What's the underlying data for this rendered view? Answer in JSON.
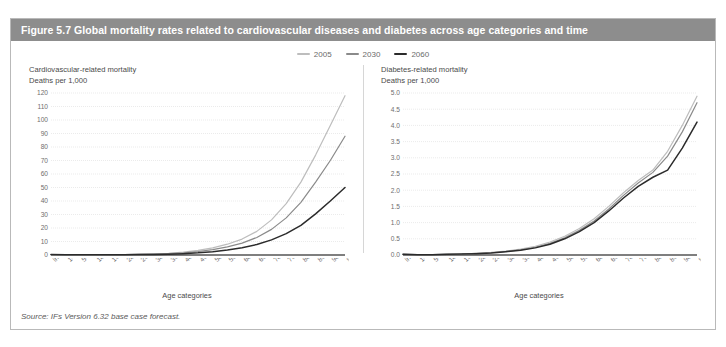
{
  "figure": {
    "title": "Figure 5.7 Global mortality rates related to cardiovascular diseases and diabetes across age categories and time",
    "source": "Source: IFs Version 6.32 base case forecast.",
    "header_color": "#8d8d8d",
    "border_color": "#b9b9b9"
  },
  "legend": {
    "position": "top-center",
    "entries": [
      {
        "label": "2005",
        "color": "#bdbdbd"
      },
      {
        "label": "2030",
        "color": "#8a8a8a"
      },
      {
        "label": "2060",
        "color": "#2b2b2b"
      }
    ]
  },
  "chart_data": [
    {
      "type": "line",
      "title": "Cardiovascular-related mortality",
      "subtitle": "Deaths per 1,000",
      "xlabel": "Age categories",
      "ylabel": "Deaths per 1,000",
      "ylim": [
        0,
        120
      ],
      "ytick_step": 10,
      "yticks": [
        0,
        10,
        20,
        30,
        40,
        50,
        60,
        70,
        80,
        90,
        100,
        110,
        120
      ],
      "grid": true,
      "categories": [
        "Infants",
        "1-4",
        "5-9",
        "10-14",
        "15-19",
        "20-24",
        "25-29",
        "30-34",
        "35-39",
        "40-44",
        "45-49",
        "50-54",
        "55-59",
        "60-64",
        "65-69",
        "70-74",
        "75-79",
        "80-84",
        "85-89",
        "90-94",
        "95-99"
      ],
      "series": [
        {
          "name": "2005",
          "color": "#bdbdbd",
          "values": [
            0.3,
            0.1,
            0.1,
            0.1,
            0.2,
            0.3,
            0.5,
            0.8,
            1.3,
            2.1,
            3.4,
            5.3,
            8.0,
            11.8,
            17.5,
            26.0,
            38.0,
            54.0,
            74.0,
            96.0,
            118.0
          ]
        },
        {
          "name": "2030",
          "color": "#8a8a8a",
          "values": [
            0.3,
            0.1,
            0.1,
            0.1,
            0.2,
            0.3,
            0.4,
            0.6,
            1.0,
            1.6,
            2.6,
            4.0,
            6.0,
            8.8,
            13.0,
            19.0,
            27.5,
            39.0,
            54.0,
            70.0,
            88.0
          ]
        },
        {
          "name": "2060",
          "color": "#2b2b2b",
          "values": [
            0.3,
            0.1,
            0.1,
            0.1,
            0.1,
            0.2,
            0.3,
            0.4,
            0.6,
            1.0,
            1.6,
            2.5,
            3.7,
            5.4,
            7.8,
            11.2,
            15.8,
            22.0,
            30.5,
            40.0,
            50.0
          ]
        }
      ]
    },
    {
      "type": "line",
      "title": "Diabetes-related mortality",
      "subtitle": "Deaths per 1,000",
      "xlabel": "Age categories",
      "ylabel": "Deaths per 1,000",
      "ylim": [
        0,
        5
      ],
      "ytick_step": 0.5,
      "yticks": [
        "0.0",
        "0.5",
        "1.0",
        "1.5",
        "2.0",
        "2.5",
        "3.0",
        "3.5",
        "4.0",
        "4.5",
        "5.0"
      ],
      "grid": true,
      "categories": [
        "Infants",
        "1-4",
        "5-9",
        "10-14",
        "15-19",
        "20-24",
        "25-29",
        "30-34",
        "35-39",
        "40-44",
        "45-49",
        "50-54",
        "55-59",
        "60-64",
        "65-69",
        "70-74",
        "75-79",
        "80-84",
        "85-89",
        "90-94",
        "95-99"
      ],
      "series": [
        {
          "name": "2005",
          "color": "#bdbdbd",
          "values": [
            0.02,
            0.01,
            0.01,
            0.02,
            0.03,
            0.05,
            0.08,
            0.12,
            0.18,
            0.27,
            0.4,
            0.58,
            0.82,
            1.12,
            1.5,
            1.92,
            2.3,
            2.62,
            3.2,
            4.0,
            4.9
          ]
        },
        {
          "name": "2030",
          "color": "#8a8a8a",
          "values": [
            0.02,
            0.01,
            0.01,
            0.02,
            0.03,
            0.05,
            0.07,
            0.11,
            0.16,
            0.24,
            0.36,
            0.53,
            0.76,
            1.05,
            1.42,
            1.84,
            2.22,
            2.55,
            3.05,
            3.8,
            4.7
          ]
        },
        {
          "name": "2060",
          "color": "#2b2b2b",
          "values": [
            0.02,
            0.01,
            0.01,
            0.02,
            0.03,
            0.04,
            0.06,
            0.1,
            0.15,
            0.22,
            0.33,
            0.5,
            0.72,
            1.0,
            1.36,
            1.76,
            2.12,
            2.4,
            2.62,
            3.3,
            4.1
          ]
        }
      ]
    }
  ]
}
